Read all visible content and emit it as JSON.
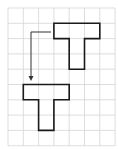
{
  "diagram": {
    "type": "grid-translation",
    "grid": {
      "origin_x": 8,
      "origin_y": 8,
      "cell": 15.3,
      "cols": 7,
      "rows": 9,
      "line_color": "#d4d4d4"
    },
    "shapes": [
      {
        "name": "original-t-shape",
        "label": "T",
        "cells": {
          "bar": {
            "col": 3,
            "row": 1,
            "w": 3,
            "h": 1
          },
          "stem": {
            "col": 4,
            "row": 2,
            "w": 1,
            "h": 2
          }
        },
        "stroke": "#1a1a1a"
      },
      {
        "name": "translated-t-shape",
        "label": "T",
        "cells": {
          "bar": {
            "col": 1,
            "row": 5,
            "w": 3,
            "h": 1
          },
          "stem": {
            "col": 2,
            "row": 6,
            "w": 1,
            "h": 2
          }
        },
        "stroke": "#1a1a1a"
      }
    ],
    "arrow": {
      "from": [
        51,
        32
      ],
      "corner": [
        31,
        32
      ],
      "to": [
        31,
        81
      ],
      "color": "#333333"
    }
  }
}
